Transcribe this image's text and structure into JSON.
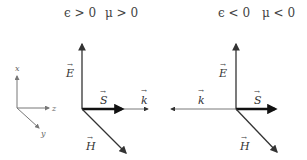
{
  "diagram": {
    "left_panel": {
      "title_eps": "ϵ > 0",
      "title_mu": "μ > 0",
      "vectors": {
        "E": "E",
        "S": "S",
        "k": "k",
        "H": "H"
      },
      "k_direction": "parallel to S (+z)"
    },
    "right_panel": {
      "title_eps": "ϵ < 0",
      "title_mu": "μ < 0",
      "vectors": {
        "E": "E",
        "S": "S",
        "k": "k",
        "H": "H"
      },
      "k_direction": "antiparallel to S (−z)"
    },
    "coordinate_axes": {
      "x": "x",
      "y": "y",
      "z": "z"
    },
    "colors": {
      "line": "#333333",
      "thick_arrow": "#111111",
      "axes": "#777777"
    }
  }
}
